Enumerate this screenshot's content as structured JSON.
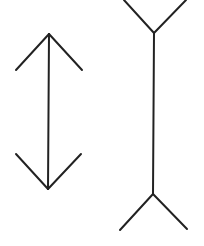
{
  "diagram": {
    "title": "Müller-Lyer illusion",
    "background": "#ffffff",
    "stroke_color": "#222222",
    "figures": [
      {
        "id": "arrow-inward-figure",
        "description": "Vertical shaft with arrowheads pointing outward (fins converge)",
        "shaft": {
          "x1": 49,
          "y1": 34,
          "x2": 48,
          "y2": 189
        },
        "top_fins": [
          {
            "x1": 49,
            "y1": 34,
            "x2": 16,
            "y2": 70
          },
          {
            "x1": 49,
            "y1": 34,
            "x2": 82,
            "y2": 70
          }
        ],
        "bottom_fins": [
          {
            "x1": 48,
            "y1": 189,
            "x2": 16,
            "y2": 154
          },
          {
            "x1": 48,
            "y1": 189,
            "x2": 81,
            "y2": 154
          }
        ]
      },
      {
        "id": "arrow-outward-figure",
        "description": "Vertical shaft with fins pointing outward (fins diverge)",
        "shaft": {
          "x1": 154,
          "y1": 33,
          "x2": 153,
          "y2": 194
        },
        "top_fins": [
          {
            "x1": 154,
            "y1": 33,
            "x2": 124,
            "y2": 0
          },
          {
            "x1": 154,
            "y1": 33,
            "x2": 186,
            "y2": 0
          }
        ],
        "bottom_fins": [
          {
            "x1": 153,
            "y1": 194,
            "x2": 120,
            "y2": 230
          },
          {
            "x1": 153,
            "y1": 194,
            "x2": 187,
            "y2": 229
          }
        ]
      }
    ]
  }
}
